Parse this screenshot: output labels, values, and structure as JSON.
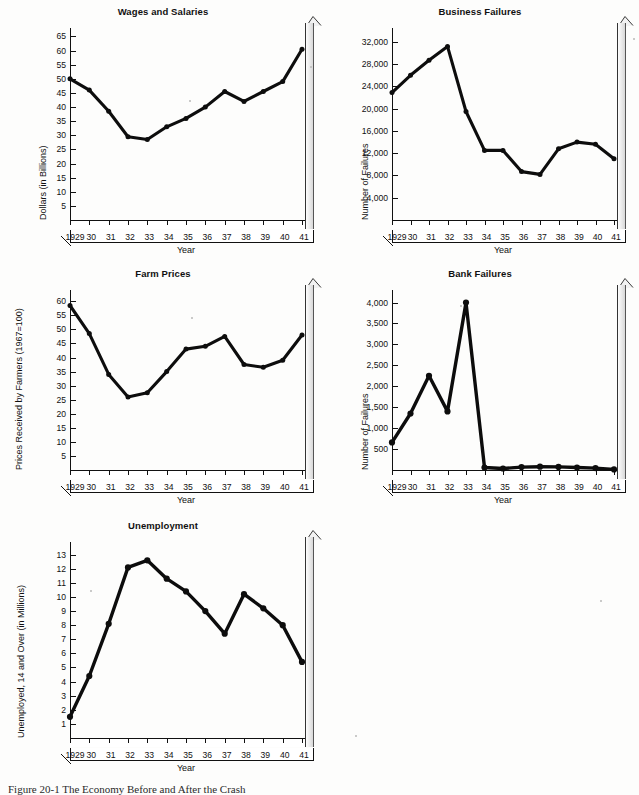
{
  "figure": {
    "caption": "Figure 20-1  The Economy Before and After the Crash",
    "axis_title_x": "Year",
    "years": [
      "1929",
      "30",
      "31",
      "32",
      "33",
      "34",
      "35",
      "36",
      "37",
      "38",
      "39",
      "40",
      "41"
    ]
  },
  "chart_data": [
    {
      "type": "line",
      "title": "Wages and Salaries",
      "xlabel": "Year",
      "ylabel": "Dollars (in Billions)",
      "categories": [
        "1929",
        "30",
        "31",
        "32",
        "33",
        "34",
        "35",
        "36",
        "37",
        "38",
        "39",
        "40",
        "41"
      ],
      "values": [
        50,
        46,
        38.5,
        29.5,
        28.5,
        33,
        36,
        40,
        45.5,
        42,
        45.5,
        49,
        60.5
      ],
      "yticks": [
        5,
        10,
        15,
        20,
        25,
        30,
        35,
        40,
        45,
        50,
        55,
        60,
        65
      ],
      "ytick_labels": [
        "5",
        "10",
        "15",
        "20",
        "25",
        "30",
        "35",
        "40",
        "45",
        "50",
        "55",
        "60",
        "65"
      ],
      "ylim": [
        0,
        68
      ],
      "grid": false,
      "legend": "none"
    },
    {
      "type": "line",
      "title": "Business Failures",
      "xlabel": "Year",
      "ylabel": "Number of Failures",
      "categories": [
        "1929",
        "30",
        "31",
        "32",
        "33",
        "34",
        "35",
        "36",
        "37",
        "38",
        "39",
        "40",
        "41"
      ],
      "values": [
        22900,
        26000,
        28700,
        31200,
        19500,
        12500,
        12500,
        8700,
        8200,
        12800,
        14000,
        13600,
        11000
      ],
      "yticks": [
        4000,
        8000,
        12000,
        16000,
        20000,
        24000,
        28000,
        32000
      ],
      "ytick_labels": [
        "4,000",
        "8,000",
        "12,000",
        "16,000",
        "20,000",
        "24,000",
        "28,000",
        "32,000"
      ],
      "ylim": [
        0,
        34500
      ],
      "grid": false,
      "legend": "none"
    },
    {
      "type": "line",
      "title": "Farm Prices",
      "xlabel": "Year",
      "ylabel": "Prices Received by Farmers (1967=100)",
      "categories": [
        "1929",
        "30",
        "31",
        "32",
        "33",
        "34",
        "35",
        "36",
        "37",
        "38",
        "39",
        "40",
        "41"
      ],
      "values": [
        58.5,
        48.5,
        34,
        26,
        27.5,
        35,
        43,
        44,
        47.5,
        37.5,
        36.5,
        39,
        48
      ],
      "yticks": [
        5,
        10,
        15,
        20,
        25,
        30,
        35,
        40,
        45,
        50,
        55,
        60
      ],
      "ytick_labels": [
        "5",
        "10",
        "15",
        "20",
        "25",
        "30",
        "35",
        "40",
        "45",
        "50",
        "55",
        "60"
      ],
      "ylim": [
        0,
        64
      ],
      "grid": false,
      "legend": "none"
    },
    {
      "type": "line",
      "title": "Bank Failures",
      "xlabel": "Year",
      "ylabel": "Number of Failures",
      "categories": [
        "1929",
        "30",
        "31",
        "32",
        "33",
        "34",
        "35",
        "36",
        "37",
        "38",
        "39",
        "40",
        "41"
      ],
      "values": [
        660,
        1350,
        2250,
        1400,
        4000,
        60,
        35,
        70,
        80,
        75,
        60,
        45,
        15
      ],
      "yticks": [
        500,
        1000,
        1500,
        2000,
        2500,
        3000,
        3500,
        4000
      ],
      "ytick_labels": [
        "500",
        "1,000",
        "1,500",
        "2,000",
        "2,500",
        "3,000",
        "3,500",
        "4,000"
      ],
      "ylim": [
        0,
        4300
      ],
      "grid": false,
      "legend": "none"
    },
    {
      "type": "line",
      "title": "Unemployment",
      "xlabel": "Year",
      "ylabel": "Unemployed, 14 and Over (in Millions)",
      "categories": [
        "1929",
        "30",
        "31",
        "32",
        "33",
        "34",
        "35",
        "36",
        "37",
        "38",
        "39",
        "40",
        "41"
      ],
      "values": [
        1.5,
        4.4,
        8.1,
        12.1,
        12.6,
        11.3,
        10.4,
        9.0,
        7.4,
        10.2,
        9.2,
        8.0,
        5.4
      ],
      "yticks": [
        1,
        2,
        3,
        4,
        5,
        6,
        7,
        8,
        9,
        10,
        11,
        12,
        13
      ],
      "ytick_labels": [
        "1",
        "2",
        "3",
        "4",
        "5",
        "6",
        "7",
        "8",
        "9",
        "10",
        "11",
        "12",
        "13"
      ],
      "ylim": [
        0,
        13.9
      ],
      "grid": false,
      "legend": "none"
    }
  ],
  "panels": [
    {
      "left": 8,
      "top": 6,
      "width": 310,
      "height": 262,
      "plot_left": 62,
      "plot_top": 22,
      "plot_w": 232,
      "plot_h": 192,
      "ytitle_off": 30,
      "style": "thick"
    },
    {
      "left": 326,
      "top": 6,
      "width": 308,
      "height": 262,
      "plot_left": 66,
      "plot_top": 22,
      "plot_w": 222,
      "plot_h": 192,
      "ytitle_off": 34,
      "style": "thick"
    },
    {
      "left": 8,
      "top": 268,
      "width": 310,
      "height": 250,
      "plot_left": 62,
      "plot_top": 22,
      "plot_w": 232,
      "plot_h": 180,
      "ytitle_off": 6,
      "style": "thick"
    },
    {
      "left": 326,
      "top": 268,
      "width": 308,
      "height": 250,
      "plot_left": 66,
      "plot_top": 22,
      "plot_w": 222,
      "plot_h": 180,
      "ytitle_off": 34,
      "style": "outline"
    },
    {
      "left": 8,
      "top": 520,
      "width": 310,
      "height": 268,
      "plot_left": 62,
      "plot_top": 22,
      "plot_w": 232,
      "plot_h": 196,
      "ytitle_off": 8,
      "style": "outline"
    }
  ]
}
